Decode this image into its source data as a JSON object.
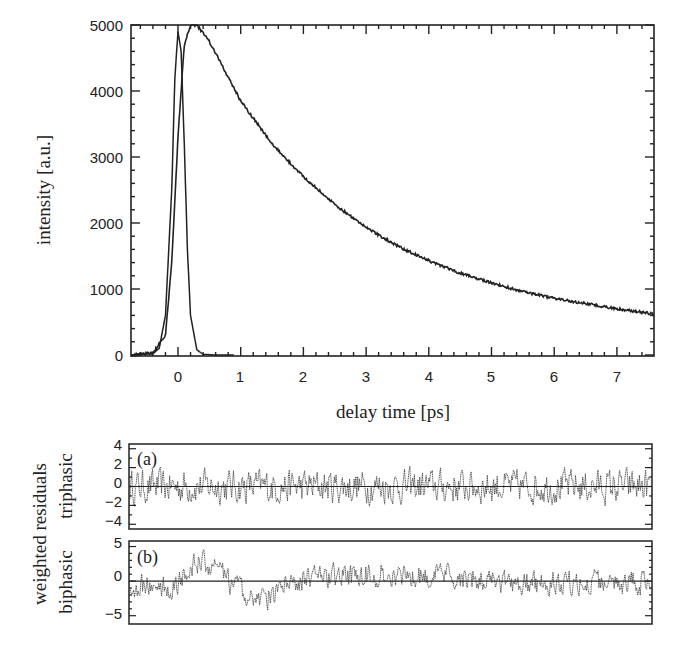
{
  "chart_data": [
    {
      "type": "line",
      "panel": "main",
      "title": "",
      "xlabel": "delay time [ps]",
      "ylabel": "intensity [a.u.]",
      "xlim": [
        -0.75,
        7.6
      ],
      "ylim": [
        0,
        5000
      ],
      "xticks": [
        0,
        1,
        2,
        3,
        4,
        5,
        6,
        7
      ],
      "yticks": [
        0,
        1000,
        2000,
        3000,
        4000,
        5000
      ],
      "grid": false,
      "legend": null,
      "series": [
        {
          "name": "instrument response (IRF)",
          "x": [
            -0.75,
            -0.4,
            -0.3,
            -0.2,
            -0.1,
            -0.05,
            0.0,
            0.05,
            0.1,
            0.15,
            0.2,
            0.3,
            0.4,
            0.6,
            0.9
          ],
          "y": [
            0,
            20,
            100,
            600,
            2500,
            4200,
            4900,
            4600,
            3200,
            1600,
            600,
            80,
            10,
            0,
            0
          ]
        },
        {
          "name": "measured transient",
          "x": [
            -0.75,
            -0.4,
            -0.2,
            -0.1,
            0.0,
            0.1,
            0.2,
            0.3,
            0.5,
            1.0,
            1.5,
            2.0,
            2.5,
            3.0,
            3.5,
            4.0,
            4.5,
            5.0,
            5.5,
            6.0,
            6.5,
            7.0,
            7.6
          ],
          "y": [
            0,
            30,
            300,
            1400,
            3300,
            4700,
            5000,
            5000,
            4750,
            3850,
            3200,
            2700,
            2280,
            1930,
            1650,
            1430,
            1240,
            1090,
            960,
            860,
            780,
            700,
            620
          ]
        }
      ]
    },
    {
      "type": "line",
      "panel": "residuals-triphasic",
      "tag": "(a)",
      "ylabel": "triphasic",
      "xlim": [
        -0.75,
        7.6
      ],
      "ylim": [
        -4.5,
        4.5
      ],
      "yticks": [
        -4,
        -2,
        0,
        2,
        4
      ],
      "description": "random-noise weighted residuals scattered about 0, amplitude mostly within ±2, occasional spikes to about -3.5"
    },
    {
      "type": "line",
      "panel": "residuals-biphasic",
      "tag": "(b)",
      "ylabel": "biphasic",
      "xlim": [
        -0.75,
        7.6
      ],
      "ylim": [
        -6,
        5.5
      ],
      "yticks": [
        -5,
        0,
        5
      ],
      "description": "weighted residuals with systematic deviation: positive bump ~+4 near 0.5 ps, negative dip ~-5 near 1.0-1.5 ps, positive trend ~+1.5 around 3-4 ps"
    }
  ],
  "labels": {
    "x_axis_title": "delay time [ps]",
    "y_axis_title": "intensity [a.u.]",
    "residuals_title": "weighted residuals",
    "panel_a_name": "triphasic",
    "panel_b_name": "biphasic",
    "panel_a_tag": "(a)",
    "panel_b_tag": "(b)"
  },
  "ticks": {
    "main_x": [
      "0",
      "1",
      "2",
      "3",
      "4",
      "5",
      "6",
      "7"
    ],
    "main_y": [
      "0",
      "1000",
      "2000",
      "3000",
      "4000",
      "5000"
    ],
    "res_a_y": [
      "4",
      "2",
      "0",
      "−2",
      "−4"
    ],
    "res_b_y": [
      "5",
      "0",
      "−5"
    ]
  }
}
